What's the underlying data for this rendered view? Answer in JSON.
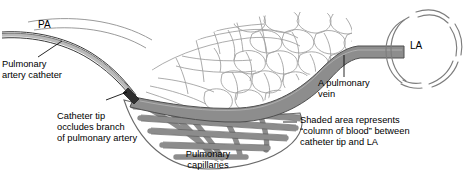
{
  "figure": {
    "kind": "medical-illustration",
    "background_color": "#ffffff",
    "ink_color": "#000000",
    "capillary_outline_color": "#9a9a9a",
    "shaded_vessel_fill": "#8d8d8d",
    "shaded_vessel_edge": "#4d4d4d",
    "catheter_color": "#6f6f6f",
    "la_outline_color": "#7d7d7d"
  },
  "labels": {
    "pa": "PA",
    "la": "LA",
    "catheter": "Pulmonary\nartery catheter",
    "catheter_tip": "Catheter tip\noccludes branch\nof pulmonary artery",
    "capillaries": "Pulmonary\ncapillaries",
    "vein": "A pulmonary\nvein",
    "shaded": "Shaded area represents\n“column of blood” between\ncatheter tip and LA"
  }
}
